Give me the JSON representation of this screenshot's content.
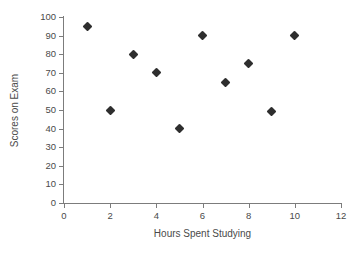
{
  "chart_data": {
    "type": "scatter",
    "title": "",
    "xlabel": "Hours Spent Studying",
    "ylabel": "Scores on Exam",
    "xlim": [
      0,
      12
    ],
    "ylim": [
      0,
      100
    ],
    "xticks": [
      0,
      2,
      4,
      6,
      8,
      10,
      12
    ],
    "yticks": [
      0,
      10,
      20,
      30,
      40,
      50,
      60,
      70,
      80,
      90,
      100
    ],
    "grid": false,
    "legend": false,
    "marker": "diamond",
    "marker_color": "#2e2e2e",
    "axis_color": "#7c7c7c",
    "series": [
      {
        "name": "Students",
        "points": [
          {
            "x": 1,
            "y": 95
          },
          {
            "x": 2,
            "y": 50
          },
          {
            "x": 3,
            "y": 80
          },
          {
            "x": 4,
            "y": 70
          },
          {
            "x": 5,
            "y": 40
          },
          {
            "x": 6,
            "y": 90
          },
          {
            "x": 7,
            "y": 65
          },
          {
            "x": 8,
            "y": 75
          },
          {
            "x": 9,
            "y": 49
          },
          {
            "x": 10,
            "y": 90
          }
        ]
      }
    ]
  }
}
